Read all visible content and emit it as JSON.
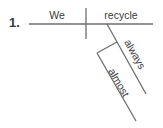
{
  "diagram": {
    "number": "1.",
    "subject": "We",
    "verb": "recycle",
    "modifiers": [
      {
        "word": "always",
        "modifies": "recycle"
      },
      {
        "word": "almost",
        "modifies": "always"
      }
    ],
    "line_color": "#6e6e6e",
    "text_color": "#3a3a3a"
  }
}
